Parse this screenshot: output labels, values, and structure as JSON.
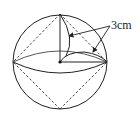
{
  "diagram": {
    "type": "sphere-with-inscribed-octahedron",
    "label": "3cm",
    "colors": {
      "stroke": "#222222",
      "background": "#ffffff"
    }
  }
}
